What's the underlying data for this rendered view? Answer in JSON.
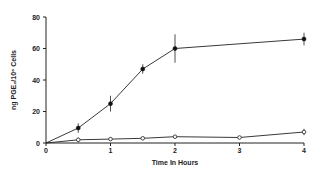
{
  "chart_data": {
    "type": "line",
    "title": "",
    "xlabel": "Time In Hours",
    "ylabel": "ng PGE₂/10⁶ Cells",
    "xlim": [
      0,
      4
    ],
    "ylim": [
      0,
      80
    ],
    "x_ticks": [
      0,
      1,
      2,
      3,
      4
    ],
    "x_tick_labels": [
      "0",
      "1",
      "2",
      "3",
      "4"
    ],
    "y_ticks": [
      0,
      20,
      40,
      60,
      80
    ],
    "y_tick_labels": [
      "0",
      "20",
      "40",
      "60",
      "80"
    ],
    "grid": false,
    "legend": null,
    "series": [
      {
        "name": "filled-circles",
        "marker": "filled-circle",
        "x": [
          0,
          0.5,
          1,
          1.5,
          2,
          4
        ],
        "values": [
          0,
          9.5,
          25,
          47,
          60,
          66
        ],
        "error": [
          0,
          3,
          5,
          3,
          9,
          4
        ]
      },
      {
        "name": "open-circles",
        "marker": "open-circle",
        "x": [
          0,
          0.5,
          1,
          1.5,
          2,
          3,
          4
        ],
        "values": [
          0,
          2,
          2.5,
          3,
          4,
          3.5,
          7
        ],
        "error": [
          0,
          1.5,
          1,
          0.5,
          1,
          0.5,
          2
        ]
      }
    ]
  }
}
